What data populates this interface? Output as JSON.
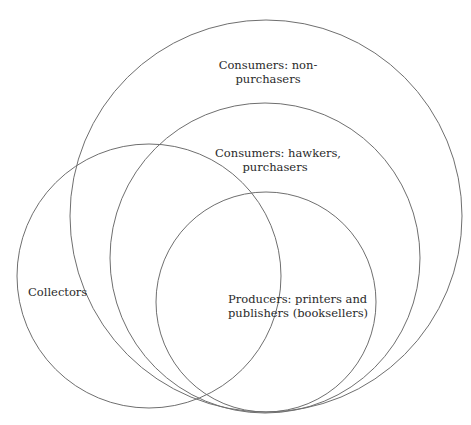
{
  "diagram": {
    "type": "nested-venn",
    "stroke_color": "#6f6f6f",
    "circles": [
      {
        "id": "non-purchasers",
        "label_lines": [
          "Consumers: non-",
          "purchasers"
        ],
        "cx": 266,
        "cy": 216,
        "r": 196
      },
      {
        "id": "hawkers-purchasers",
        "label_lines": [
          "Consumers: hawkers,",
          "purchasers"
        ],
        "cx": 265,
        "cy": 258,
        "r": 155
      },
      {
        "id": "collectors",
        "label_lines": [
          "Collectors"
        ],
        "cx": 149,
        "cy": 276,
        "r": 132
      },
      {
        "id": "producers",
        "label_lines": [
          "Producers: printers and",
          "publishers (booksellers)"
        ],
        "cx": 266,
        "cy": 302,
        "r": 110
      }
    ]
  }
}
